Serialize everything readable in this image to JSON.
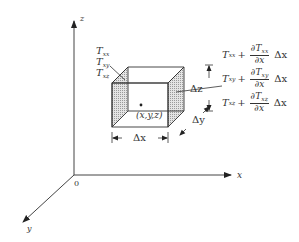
{
  "axes": {
    "x_label": "x",
    "y_label": "y",
    "z_label": "z",
    "origin_label": "0"
  },
  "left_face": {
    "stresses": [
      {
        "sym": "T",
        "sub": "xx"
      },
      {
        "sym": "T",
        "sub": "xy"
      },
      {
        "sym": "T",
        "sub": "xz"
      }
    ]
  },
  "right_face": {
    "equations": [
      {
        "sym": "T",
        "sub": "xx",
        "plus": "+",
        "num_d": "∂T",
        "num_sub": "xx",
        "den": "∂x",
        "delta": "Δx"
      },
      {
        "sym": "T",
        "sub": "xy",
        "plus": "+",
        "num_d": "∂T",
        "num_sub": "xy",
        "den": "∂x",
        "delta": "Δx"
      },
      {
        "sym": "T",
        "sub": "xz",
        "plus": "+",
        "num_d": "∂T",
        "num_sub": "xz",
        "den": "∂x",
        "delta": "Δx"
      }
    ]
  },
  "cube": {
    "center_label": "(x,y,z)",
    "dx_label": "Δx",
    "dy_label": "Δy",
    "dz_label": "Δz"
  }
}
